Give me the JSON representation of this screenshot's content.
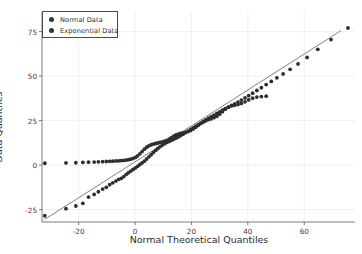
{
  "chart_data": {
    "type": "scatter",
    "title": "",
    "subtitle": "",
    "xlabel": "Normal Theoretical Quantiles",
    "ylabel": "Data Quantiles",
    "xlim": [
      -33,
      78
    ],
    "ylim": [
      -32,
      86
    ],
    "xticks": [
      -20,
      0,
      20,
      40,
      60
    ],
    "yticks": [
      -25,
      0,
      25,
      50,
      75
    ],
    "xticklabels": [
      "-20",
      "0",
      "20",
      "40",
      "60"
    ],
    "yticklabels": [
      "-25",
      "0",
      "25",
      "50",
      "75"
    ],
    "grid": true,
    "grid_color": "#e9e9e9",
    "legend_position": "upper left",
    "reference_line": {
      "name": "45-degree reference line",
      "x0": -32.0,
      "y0": -30.5,
      "x1": 73.0,
      "y1": 75.5,
      "color": "#4a4a4a",
      "width": 0.7
    },
    "marker_color": "#2e2e2e",
    "marker_size": 1.9,
    "series": [
      {
        "name": "Normal Data",
        "color": "#2e2e2e",
        "x": [
          -32.0,
          -24.5,
          -21.0,
          -18.5,
          -16.5,
          -14.5,
          -13.0,
          -11.5,
          -10.2,
          -9.0,
          -7.9,
          -6.8,
          -5.8,
          -4.9,
          -4.0,
          -3.1,
          -2.3,
          -1.5,
          -0.7,
          0.1,
          0.9,
          1.7,
          2.5,
          3.3,
          4.1,
          4.9,
          5.7,
          6.5,
          7.3,
          8.1,
          8.9,
          9.7,
          10.5,
          11.3,
          12.1,
          12.9,
          13.7,
          14.5,
          15.3,
          16.1,
          17.0,
          17.9,
          18.8,
          19.7,
          20.6,
          21.5,
          22.4,
          23.3,
          24.2,
          25.1,
          26.0,
          27.0,
          28.0,
          29.0,
          30.0,
          31.0,
          32.0,
          33.1,
          34.2,
          35.3,
          36.5,
          37.7,
          39.0,
          40.3,
          41.7,
          43.2,
          44.8,
          46.5,
          48.3,
          50.3,
          52.5,
          55.0,
          57.8,
          61.0,
          64.8,
          69.5,
          75.5
        ],
        "y": [
          -28.5,
          -24.5,
          -23.0,
          -21.5,
          -18.0,
          -16.5,
          -15.0,
          -13.5,
          -12.5,
          -11.0,
          -10.0,
          -9.0,
          -8.0,
          -7.5,
          -6.5,
          -5.2,
          -4.3,
          -3.4,
          -2.5,
          -1.6,
          -0.7,
          0.3,
          1.2,
          2.2,
          3.4,
          4.6,
          5.8,
          7.0,
          8.2,
          9.3,
          10.3,
          11.2,
          12.0,
          12.7,
          13.3,
          13.9,
          14.5,
          15.1,
          15.8,
          16.5,
          17.3,
          18.2,
          19.1,
          20.0,
          20.9,
          21.8,
          22.7,
          23.6,
          24.5,
          25.4,
          26.3,
          27.2,
          28.1,
          29.0,
          29.9,
          30.8,
          31.7,
          32.6,
          33.5,
          34.4,
          35.4,
          36.5,
          37.7,
          39.0,
          40.4,
          41.9,
          43.5,
          45.2,
          47.0,
          49.0,
          51.2,
          53.8,
          56.8,
          60.5,
          65.0,
          70.5,
          77.0
        ]
      },
      {
        "name": "Exponential Data",
        "color": "#2e2e2e",
        "x": [
          -32.0,
          -24.5,
          -21.0,
          -18.5,
          -16.5,
          -14.5,
          -13.0,
          -11.5,
          -10.2,
          -9.0,
          -7.9,
          -6.8,
          -5.8,
          -4.9,
          -4.0,
          -3.1,
          -2.3,
          -1.5,
          -0.7,
          0.1,
          0.9,
          1.7,
          2.5,
          3.3,
          4.1,
          4.9,
          5.7,
          6.5,
          7.3,
          8.1,
          8.9,
          9.7,
          10.5,
          11.3,
          12.1,
          12.9,
          13.7,
          14.5,
          15.3,
          16.1,
          17.0,
          17.9,
          18.8,
          19.7,
          20.6,
          21.5,
          22.4,
          23.3,
          24.2,
          25.1,
          26.0,
          27.0,
          28.0,
          29.0,
          30.0,
          31.0,
          32.0,
          33.1,
          34.2,
          35.3,
          36.5,
          37.7,
          39.0,
          40.3,
          41.7,
          43.2,
          44.8,
          46.5
        ],
        "y": [
          1.0,
          1.2,
          1.3,
          1.5,
          1.6,
          1.7,
          1.8,
          1.9,
          2.0,
          2.1,
          2.2,
          2.3,
          2.4,
          2.5,
          2.6,
          2.8,
          3.0,
          3.3,
          3.7,
          4.3,
          5.2,
          6.3,
          7.6,
          8.9,
          10.0,
          10.8,
          11.4,
          11.8,
          12.1,
          12.4,
          12.7,
          13.0,
          13.4,
          13.9,
          14.6,
          15.4,
          16.2,
          16.9,
          17.4,
          17.8,
          18.1,
          18.4,
          18.8,
          19.4,
          20.2,
          21.2,
          22.3,
          23.3,
          24.2,
          24.9,
          25.5,
          26.0,
          26.6,
          27.4,
          28.6,
          30.0,
          31.4,
          32.5,
          33.2,
          33.6,
          34.0,
          34.6,
          35.5,
          36.6,
          37.6,
          38.2,
          38.5,
          38.7
        ]
      }
    ]
  },
  "legend": {
    "entries": [
      {
        "label": "Normal Data",
        "marker": "circle-marker"
      },
      {
        "label": "Exponential Data",
        "marker": "circle-marker"
      }
    ]
  }
}
